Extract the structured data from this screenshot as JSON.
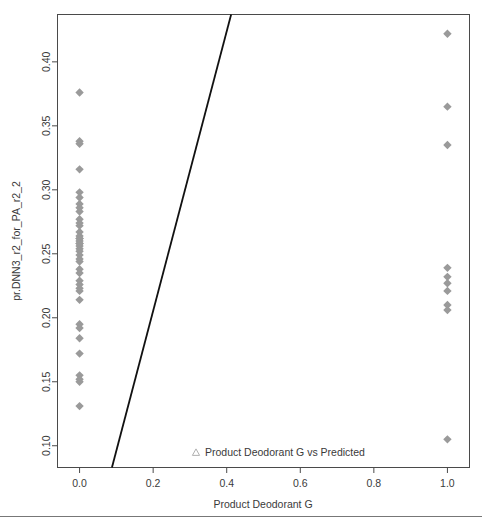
{
  "chart_data": {
    "type": "scatter",
    "title": "",
    "xlabel": "Product Deodorant G",
    "ylabel": "pr.DNN3_r2_for_PA_r2_2",
    "xlim": [
      -0.06,
      1.06
    ],
    "ylim": [
      0.083,
      0.437
    ],
    "xticks": [
      0.0,
      0.2,
      0.4,
      0.6,
      0.8,
      1.0
    ],
    "xticklabels": [
      "0.0",
      "0.2",
      "0.4",
      "0.6",
      "0.8",
      "1.0"
    ],
    "yticks": [
      0.1,
      0.15,
      0.2,
      0.25,
      0.3,
      0.35,
      0.4
    ],
    "yticklabels": [
      "0.10",
      "0.15",
      "0.20",
      "0.25",
      "0.30",
      "0.35",
      "0.40"
    ],
    "grid": false,
    "legend_position": "bottom-center",
    "legend": [
      {
        "label": "Product Deodorant G vs Predicted",
        "marker": "triangle-open",
        "color": "#b0b0b0"
      }
    ],
    "marker_style": "diamond",
    "marker_color": "#9a9a9a",
    "marker_size": 4.2,
    "series": [
      {
        "name": "Product Deodorant G vs Predicted",
        "x": [
          0.0,
          0.0,
          0.0,
          0.0,
          0.0,
          0.0,
          0.0,
          0.0,
          0.0,
          0.0,
          0.0,
          0.0,
          0.0,
          0.0,
          0.0,
          0.0,
          0.0,
          0.0,
          0.0,
          0.0,
          0.0,
          0.0,
          0.0,
          0.0,
          0.0,
          0.0,
          0.0,
          0.0,
          0.0,
          0.0,
          0.0,
          0.0,
          0.0,
          0.0,
          0.0,
          0.0,
          0.0,
          0.0,
          0.0,
          0.0,
          1.0,
          1.0,
          1.0,
          1.0,
          1.0,
          1.0,
          1.0,
          1.0,
          1.0,
          1.0
        ],
        "y": [
          0.376,
          0.338,
          0.336,
          0.316,
          0.298,
          0.294,
          0.289,
          0.286,
          0.283,
          0.277,
          0.274,
          0.272,
          0.267,
          0.264,
          0.262,
          0.26,
          0.258,
          0.256,
          0.254,
          0.252,
          0.249,
          0.246,
          0.244,
          0.238,
          0.235,
          0.229,
          0.226,
          0.223,
          0.221,
          0.214,
          0.195,
          0.192,
          0.184,
          0.172,
          0.155,
          0.152,
          0.15,
          0.131,
          0.262,
          0.258,
          0.422,
          0.365,
          0.335,
          0.239,
          0.232,
          0.227,
          0.221,
          0.21,
          0.206,
          0.105
        ]
      }
    ],
    "fit_line": {
      "x": [
        0.088,
        0.412
      ],
      "y": [
        0.083,
        0.437
      ],
      "color": "#111111",
      "description": "linear regression fit"
    }
  },
  "axis": {
    "x_title": "Product Deodorant G",
    "y_title": "pr.DNN3_r2_for_PA_r2_2"
  }
}
